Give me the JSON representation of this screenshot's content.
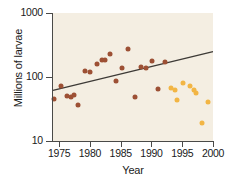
{
  "chart_data": {
    "type": "scatter",
    "title": "",
    "xlabel": "Year",
    "ylabel": "Millions of larvae",
    "xlim": [
      1974,
      2000
    ],
    "ylim": [
      10,
      1000
    ],
    "yscale": "log",
    "grid": false,
    "legend": "none",
    "xticks": [
      1975,
      1980,
      1985,
      1990,
      1995,
      2000
    ],
    "xtick_labels": [
      "1975",
      "1980",
      "1985",
      "1990",
      "1995",
      "2000"
    ],
    "yticks": [
      10,
      100,
      1000
    ],
    "ytick_labels": [
      "10",
      "100",
      "1000"
    ],
    "colors": {
      "series_early": "#9d5034",
      "series_late": "#f2b544",
      "trend_line": "#3d3a36",
      "panel_background": "#f4eee2",
      "axis": "#4a4a48"
    },
    "series": [
      {
        "name": "series-early",
        "color": "#9d5034",
        "points": [
          {
            "x": 1974.2,
            "y": 45
          },
          {
            "x": 1975.3,
            "y": 72
          },
          {
            "x": 1976.2,
            "y": 50
          },
          {
            "x": 1976.9,
            "y": 49
          },
          {
            "x": 1977.4,
            "y": 53
          },
          {
            "x": 1978.0,
            "y": 36
          },
          {
            "x": 1979.2,
            "y": 123
          },
          {
            "x": 1980.0,
            "y": 120
          },
          {
            "x": 1981.1,
            "y": 160
          },
          {
            "x": 1982.0,
            "y": 182
          },
          {
            "x": 1982.4,
            "y": 185
          },
          {
            "x": 1983.2,
            "y": 230
          },
          {
            "x": 1984.3,
            "y": 88
          },
          {
            "x": 1985.2,
            "y": 137
          },
          {
            "x": 1986.2,
            "y": 270
          },
          {
            "x": 1987.3,
            "y": 48
          },
          {
            "x": 1988.3,
            "y": 142
          },
          {
            "x": 1989.1,
            "y": 137
          },
          {
            "x": 1990.1,
            "y": 180
          },
          {
            "x": 1991.1,
            "y": 65
          },
          {
            "x": 1992.2,
            "y": 170
          }
        ]
      },
      {
        "name": "series-late",
        "color": "#f2b544",
        "points": [
          {
            "x": 1993.1,
            "y": 68
          },
          {
            "x": 1993.8,
            "y": 62
          },
          {
            "x": 1994.2,
            "y": 44
          },
          {
            "x": 1995.1,
            "y": 80
          },
          {
            "x": 1996.2,
            "y": 72
          },
          {
            "x": 1996.9,
            "y": 62
          },
          {
            "x": 1997.3,
            "y": 57
          },
          {
            "x": 1998.2,
            "y": 19
          },
          {
            "x": 1999.2,
            "y": 40
          }
        ]
      }
    ],
    "trend_line": {
      "name": "regression-line",
      "color": "#3d3a36",
      "x_start": 1974,
      "y_start": 62,
      "x_end": 2000,
      "y_end": 250
    }
  },
  "axis": {
    "y_title": "Millions of larvae",
    "x_title": "Year"
  }
}
